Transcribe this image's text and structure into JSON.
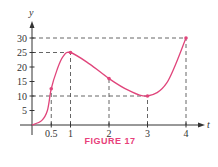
{
  "figure": {
    "caption": "FIGURE 17"
  },
  "colors": {
    "curve": "#e0457b",
    "axis": "#333333",
    "guide_dash": "#555555",
    "guide_dash_alt": "#3a6fb0",
    "guide_highlight": "#7fc96a",
    "caption": "#e8407a"
  },
  "chart_data": {
    "type": "line",
    "title": "FIGURE 17",
    "xlabel": "t",
    "ylabel": "y",
    "xlim": [
      0,
      4.4
    ],
    "ylim": [
      0,
      33
    ],
    "grid": false,
    "x_ticks": [
      0.5,
      1,
      2,
      3,
      4
    ],
    "x_tick_labels": [
      "0.5",
      "1",
      "2",
      "3",
      "4"
    ],
    "y_ticks": [
      5,
      10,
      15,
      20,
      25,
      30
    ],
    "y_tick_labels": [
      "5",
      "10",
      "15",
      "20",
      "25",
      "30"
    ],
    "marked_points": [
      {
        "t": 0.5,
        "y": 12.5
      },
      {
        "t": 1,
        "y": 25
      },
      {
        "t": 2,
        "y": 16
      },
      {
        "t": 3,
        "y": 10
      },
      {
        "t": 4,
        "y": 30
      }
    ],
    "curve_samples": [
      {
        "t": 0,
        "y": 0
      },
      {
        "t": 0.25,
        "y": 1.5
      },
      {
        "t": 0.4,
        "y": 5
      },
      {
        "t": 0.5,
        "y": 12.5
      },
      {
        "t": 0.65,
        "y": 19
      },
      {
        "t": 0.8,
        "y": 23.5
      },
      {
        "t": 1,
        "y": 25
      },
      {
        "t": 1.5,
        "y": 21
      },
      {
        "t": 2,
        "y": 16
      },
      {
        "t": 2.5,
        "y": 12
      },
      {
        "t": 3,
        "y": 10
      },
      {
        "t": 3.5,
        "y": 14.5
      },
      {
        "t": 4,
        "y": 30
      }
    ],
    "guide_lines": [
      {
        "from": {
          "t": 0,
          "y": 30
        },
        "to": {
          "t": 4,
          "y": 30
        }
      },
      {
        "from": {
          "t": 0,
          "y": 25
        },
        "to": {
          "t": 1,
          "y": 25
        }
      },
      {
        "from": {
          "t": 0,
          "y": 10
        },
        "to": {
          "t": 3,
          "y": 10
        }
      },
      {
        "from": {
          "t": 0.5,
          "y": 0
        },
        "to": {
          "t": 0.5,
          "y": 12.5
        }
      },
      {
        "from": {
          "t": 1,
          "y": 0
        },
        "to": {
          "t": 1,
          "y": 25
        }
      },
      {
        "from": {
          "t": 2,
          "y": 0
        },
        "to": {
          "t": 2,
          "y": 16
        }
      },
      {
        "from": {
          "t": 3,
          "y": 0
        },
        "to": {
          "t": 3,
          "y": 10
        }
      },
      {
        "from": {
          "t": 4,
          "y": 0
        },
        "to": {
          "t": 4,
          "y": 30
        }
      }
    ]
  }
}
